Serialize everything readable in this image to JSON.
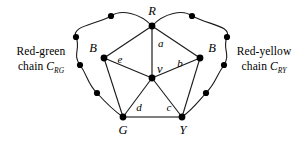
{
  "figure": {
    "background_color": "#ffffff",
    "stroke_color": "#1a1a1a",
    "node_color": "#000000",
    "width": 307,
    "height": 142
  },
  "captions": {
    "left": {
      "line1": "Red-green",
      "line2_prefix": "chain ",
      "line2_var": "C",
      "line2_sub": "RG"
    },
    "right": {
      "line1": "Red-yellow",
      "line2_prefix": "chain ",
      "line2_var": "C",
      "line2_sub": "RY"
    }
  },
  "vertex_labels": {
    "top": "R",
    "left_b": "B",
    "right_b": "B",
    "center": "v",
    "bottom_left": "G",
    "bottom_right": "Y"
  },
  "edge_labels": {
    "a": "a",
    "b": "b",
    "c": "c",
    "d": "d",
    "e": "e"
  },
  "graph_data": {
    "type": "graph",
    "inner_vertices": [
      {
        "id": "R",
        "label": "R",
        "x": 152,
        "y": 26
      },
      {
        "id": "Bleft",
        "label": "B",
        "x": 104,
        "y": 58
      },
      {
        "id": "Bright",
        "label": "B",
        "x": 200,
        "y": 58
      },
      {
        "id": "v",
        "label": "v",
        "x": 152,
        "y": 78
      },
      {
        "id": "G",
        "label": "G",
        "x": 123,
        "y": 117
      },
      {
        "id": "Y",
        "label": "Y",
        "x": 182,
        "y": 117
      }
    ],
    "inner_edges": [
      {
        "from": "R",
        "to": "v",
        "label": "a"
      },
      {
        "from": "v",
        "to": "Bright",
        "label": "b"
      },
      {
        "from": "v",
        "to": "Y",
        "label": "c"
      },
      {
        "from": "v",
        "to": "G",
        "label": "d"
      },
      {
        "from": "v",
        "to": "Bleft",
        "label": "e"
      },
      {
        "from": "R",
        "to": "Bleft",
        "label": ""
      },
      {
        "from": "R",
        "to": "Bright",
        "label": ""
      },
      {
        "from": "Bleft",
        "to": "G",
        "label": ""
      },
      {
        "from": "Bright",
        "to": "Y",
        "label": ""
      },
      {
        "from": "G",
        "to": "Y",
        "label": ""
      }
    ],
    "left_chain_nodes": [
      {
        "x": 111,
        "y": 16
      },
      {
        "x": 76,
        "y": 36
      },
      {
        "x": 80,
        "y": 64
      },
      {
        "x": 97,
        "y": 93
      }
    ],
    "right_chain_nodes": [
      {
        "x": 192,
        "y": 16
      },
      {
        "x": 227,
        "y": 36
      },
      {
        "x": 224,
        "y": 64
      },
      {
        "x": 206,
        "y": 93
      }
    ],
    "left_chain_path": "M152,26 C140,14 122,10 111,16 C94,24 72,26 76,36 C80,48 73,54 80,64 C87,75 88,82 97,93 C105,103 113,110 123,117",
    "right_chain_path": "M152,26 C164,14 182,10 192,16 C209,24 231,26 227,36 C223,48 230,54 224,64 C217,75 215,82 206,93 C198,103 191,110 182,117",
    "vertex_label_positions": {
      "R": {
        "x": 152,
        "y": 14,
        "anchor": "middle"
      },
      "Bleft": {
        "x": 93,
        "y": 52,
        "anchor": "middle"
      },
      "Bright": {
        "x": 211,
        "y": 52,
        "anchor": "middle"
      },
      "v": {
        "x": 158,
        "y": 72,
        "anchor": "start"
      },
      "G": {
        "x": 123,
        "y": 133,
        "anchor": "middle"
      },
      "Y": {
        "x": 183,
        "y": 133,
        "anchor": "middle"
      }
    },
    "edge_label_positions": {
      "a": {
        "x": 158,
        "y": 46
      },
      "b": {
        "x": 180,
        "y": 66
      },
      "c": {
        "x": 168,
        "y": 110
      },
      "d": {
        "x": 139,
        "y": 110
      },
      "e": {
        "x": 120,
        "y": 62
      }
    }
  }
}
